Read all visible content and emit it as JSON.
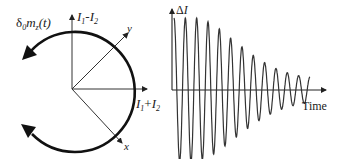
{
  "left_panel": {
    "rotation_label": "δ₀m_z(t)",
    "rotation_label_parts": {
      "delta": "δ",
      "sub0": "0",
      "m": "m",
      "subz": "z",
      "arg": "(t)"
    },
    "vertical_axis_label": {
      "a": "I",
      "a_sub": "1",
      "op": "-",
      "b": "I",
      "b_sub": "2"
    },
    "horizontal_axis_label": {
      "a": "I",
      "a_sub": "1",
      "op": "+",
      "b": "I",
      "b_sub": "2"
    },
    "y_axis_label": "y",
    "x_axis_label": "x",
    "colors": {
      "arc": "#111111",
      "axes": "#333333"
    }
  },
  "right_panel": {
    "y_axis_label": {
      "delta": "Δ",
      "var": "I"
    },
    "x_axis_label": "Time",
    "colors": {
      "wave": "#333333",
      "axes": "#222222"
    }
  },
  "chart_data": {
    "type": "line",
    "title": "",
    "xlabel": "Time",
    "ylabel": "ΔI",
    "x": [
      0,
      1,
      2,
      3,
      4,
      5,
      6,
      7,
      8,
      9,
      10,
      11,
      12
    ],
    "peak_amplitudes": [
      1.0,
      1.0,
      1.0,
      0.95,
      0.85,
      0.72,
      0.6,
      0.48,
      0.38,
      0.3,
      0.24,
      0.2,
      0.18
    ],
    "grid": false
  }
}
